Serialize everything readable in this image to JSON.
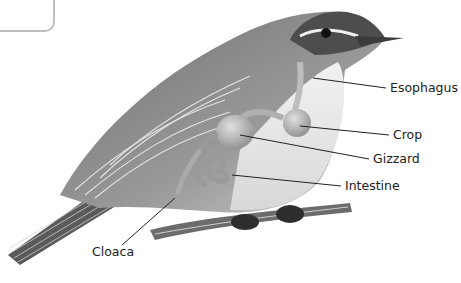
{
  "diagram": {
    "colors": {
      "ink": "#222222",
      "body": "#8a8a8a",
      "organ": "#b8b8b8",
      "background": "#ffffff"
    },
    "labels": [
      {
        "id": "esophagus",
        "text": "Esophagus",
        "x": 390,
        "y": 82
      },
      {
        "id": "crop",
        "text": "Crop",
        "x": 393,
        "y": 129
      },
      {
        "id": "gizzard",
        "text": "Gizzard",
        "x": 373,
        "y": 153
      },
      {
        "id": "intestine",
        "text": "Intestine",
        "x": 345,
        "y": 180
      },
      {
        "id": "cloaca",
        "text": "Cloaca",
        "x": 92,
        "y": 246
      }
    ]
  }
}
